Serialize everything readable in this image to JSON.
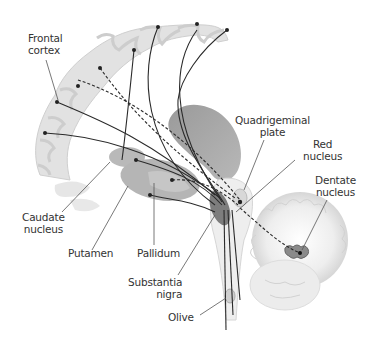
{
  "diagram": {
    "type": "anatomical-illustration",
    "colors": {
      "background": "#ffffff",
      "cortex_fill": "#e4e4e4",
      "white_matter": "#f7f7f7",
      "ventricle_fill": "#a9a9a9",
      "nucleus_fill": "#b5b5b5",
      "pathway_stroke": "#2a2a2a",
      "label_text": "#333333",
      "leader_line": "#555555"
    },
    "labels": {
      "frontal_cortex": "Frontal\ncortex",
      "quadrigeminal_plate": "Quadrigeminal\nplate",
      "red_nucleus": "Red\nnucleus",
      "dentate_nucleus": "Dentate\nnucleus",
      "caudate_nucleus": "Caudate\nnucleus",
      "putamen": "Putamen",
      "pallidum": "Pallidum",
      "substantia_nigra": "Substantia\nnigra",
      "olive": "Olive"
    }
  }
}
